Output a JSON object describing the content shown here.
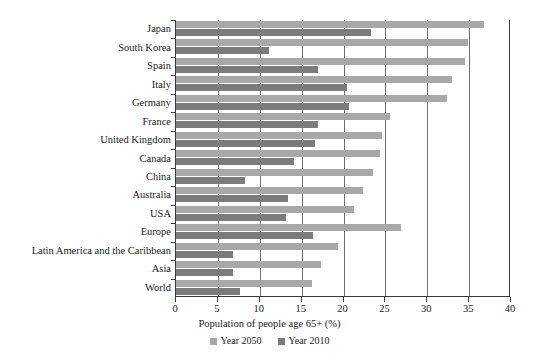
{
  "chart_data": {
    "type": "bar",
    "orientation": "horizontal",
    "title": "",
    "xlabel": "Population of people age 65+ (%)",
    "ylabel": "",
    "xlim": [
      0,
      40
    ],
    "xticks": [
      0,
      5,
      10,
      15,
      20,
      25,
      30,
      35,
      40
    ],
    "grid": true,
    "grid_axis": "x",
    "legend_position": "bottom-center",
    "categories": [
      "Japan",
      "South Korea",
      "Spain",
      "Italy",
      "Germany",
      "France",
      "United Kingdom",
      "Canada",
      "China",
      "Australia",
      "USA",
      "Europe",
      "Latin America and the Caribbean",
      "Asia",
      "World"
    ],
    "series": [
      {
        "name": "Year 2050",
        "color": "#a8a8a8",
        "values": [
          36.8,
          34.9,
          34.5,
          33.0,
          32.3,
          25.5,
          24.6,
          24.3,
          23.5,
          22.3,
          21.3,
          26.9,
          19.4,
          17.3,
          16.2
        ]
      },
      {
        "name": "Year 2010",
        "color": "#7c7c7c",
        "values": [
          23.3,
          11.1,
          17.0,
          20.4,
          20.7,
          16.9,
          16.6,
          14.1,
          8.2,
          13.4,
          13.1,
          16.4,
          6.8,
          6.8,
          7.6
        ]
      }
    ]
  },
  "axis": {
    "x_title": "Population of people age 65+ (%)",
    "tick_labels": [
      "0",
      "5",
      "10",
      "15",
      "20",
      "25",
      "30",
      "35",
      "40"
    ]
  },
  "legend": {
    "items": [
      {
        "label": "Year 2050",
        "color": "#a8a8a8"
      },
      {
        "label": "Year 2010",
        "color": "#7c7c7c"
      }
    ]
  },
  "colors": {
    "series_2050": "#a8a8a8",
    "series_2010": "#7c7c7c",
    "axis": "#3a3a3a",
    "gridline": "#6b6b6b",
    "text": "#1a1a1a",
    "background": "#ffffff"
  }
}
